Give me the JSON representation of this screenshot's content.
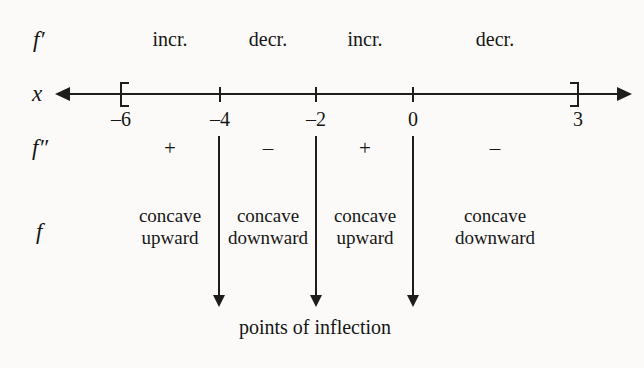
{
  "figure": {
    "caption": "points of inflection",
    "ink_color": "#1d1d1d",
    "background_color": "#fbfaf8"
  },
  "rows": {
    "f_prime": {
      "label": "f′",
      "label_x": 33,
      "label_y": 28
    },
    "x_axis": {
      "label": "x",
      "label_x": 32,
      "label_y": 82
    },
    "f_double_prime": {
      "label": "f″",
      "label_x": 32,
      "label_y": 136
    },
    "f": {
      "label": "f",
      "label_x": 36,
      "label_y": 220
    }
  },
  "axis": {
    "left_arrow_tip_x": 55,
    "right_arrow_tip_x": 632,
    "line_y": 93,
    "endpoints": [
      {
        "name": "left-bracket",
        "value": "–6",
        "x": 121,
        "type": "bracket-left"
      },
      {
        "name": "right-bracket",
        "value": "3",
        "x": 578,
        "type": "bracket-right"
      }
    ],
    "ticks": [
      {
        "value": "–6",
        "x": 121,
        "has_mark": false
      },
      {
        "value": "–4",
        "x": 220,
        "has_mark": true
      },
      {
        "value": "–2",
        "x": 316,
        "has_mark": true
      },
      {
        "value": "0",
        "x": 413,
        "has_mark": true
      },
      {
        "value": "3",
        "x": 578,
        "has_mark": false
      }
    ],
    "tick_label_y": 108
  },
  "intervals": [
    {
      "id": "interval-1",
      "center_x": 170,
      "f_prime": "incr.",
      "f_double_prime_sign": "+",
      "concavity_line1": "concave",
      "concavity_line2": "upward"
    },
    {
      "id": "interval-2",
      "center_x": 268,
      "f_prime": "decr.",
      "f_double_prime_sign": "–",
      "concavity_line1": "concave",
      "concavity_line2": "downward"
    },
    {
      "id": "interval-3",
      "center_x": 365,
      "f_prime": "incr.",
      "f_double_prime_sign": "+",
      "concavity_line1": "concave",
      "concavity_line2": "upward"
    },
    {
      "id": "interval-4",
      "center_x": 495,
      "f_prime": "decr.",
      "f_double_prime_sign": "–",
      "concavity_line1": "concave",
      "concavity_line2": "downward"
    }
  ],
  "inflection_markers": [
    {
      "at_value": "–4",
      "x": 219,
      "top_y": 136,
      "tip_y": 307
    },
    {
      "at_value": "–2",
      "x": 316,
      "top_y": 136,
      "tip_y": 307
    },
    {
      "at_value": "0",
      "x": 413,
      "top_y": 136,
      "tip_y": 307
    }
  ],
  "labels": {
    "f_prime_row_y": 28,
    "sign_row_y": 136,
    "concavity_row_y": 205,
    "caption_x": 315,
    "caption_y": 316
  }
}
